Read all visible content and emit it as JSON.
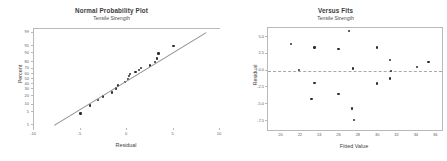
{
  "figure": {
    "panels": [
      "normal-probability-plot",
      "versus-fits"
    ]
  },
  "chart_data": [
    {
      "type": "scatter",
      "id": "normal-probability-plot",
      "title": "Normal Probability Plot",
      "subtitle": "Tensile Strength",
      "xlabel": "Residual",
      "ylabel": "Percent",
      "xlim": [
        -10,
        10
      ],
      "xticks": [
        -10,
        -5,
        0,
        5,
        10
      ],
      "xticklabels": [
        "-10",
        "-5",
        "0",
        "5",
        "10"
      ],
      "yscale": "normal-probability",
      "yticks": [
        1,
        5,
        10,
        20,
        30,
        40,
        50,
        60,
        70,
        80,
        90,
        95,
        99
      ],
      "yticklabels": [
        "1",
        "5",
        "10",
        "20",
        "30",
        "40",
        "50",
        "60",
        "70",
        "80",
        "90",
        "95",
        "99"
      ],
      "grid": false,
      "legend": "none",
      "reference_line": {
        "label": "normal fit line",
        "x1": -7.8,
        "y1": 1,
        "x2": 8.5,
        "y2": 99
      },
      "points": [
        {
          "x": -5.0,
          "y": 4.2
        },
        {
          "x": -4.0,
          "y": 9.0
        },
        {
          "x": -3.1,
          "y": 14.5
        },
        {
          "x": -2.6,
          "y": 19.0
        },
        {
          "x": -1.6,
          "y": 25.0
        },
        {
          "x": -1.2,
          "y": 31.5
        },
        {
          "x": -1.0,
          "y": 37.0
        },
        {
          "x": -0.2,
          "y": 43.5
        },
        {
          "x": 0.1,
          "y": 50.0
        },
        {
          "x": 0.2,
          "y": 56.0
        },
        {
          "x": 0.3,
          "y": 59.5
        },
        {
          "x": 0.9,
          "y": 63.5
        },
        {
          "x": 1.3,
          "y": 68.0
        },
        {
          "x": 1.5,
          "y": 70.5
        },
        {
          "x": 2.5,
          "y": 75.0
        },
        {
          "x": 3.0,
          "y": 80.5
        },
        {
          "x": 3.2,
          "y": 85.0
        },
        {
          "x": 3.4,
          "y": 90.0
        },
        {
          "x": 5.0,
          "y": 95.0
        }
      ]
    },
    {
      "type": "scatter",
      "id": "versus-fits",
      "title": "Versus Fits",
      "subtitle": "Tensile Strength",
      "xlabel": "Fitted Value",
      "ylabel": "Residual",
      "xlim": [
        18.6,
        36.6
      ],
      "xticks": [
        20,
        22,
        24,
        26,
        28,
        30,
        32,
        34,
        36
      ],
      "xticklabels": [
        "20",
        "22",
        "24",
        "26",
        "28",
        "30",
        "32",
        "34",
        "36"
      ],
      "ylim": [
        -8.8,
        6.3
      ],
      "yticks": [
        5.0,
        2.5,
        0.0,
        -2.5,
        -5.0,
        -7.5
      ],
      "yticklabels": [
        "5.0",
        "2.5",
        "0.0",
        "-2.5",
        "-5.0",
        "-7.5"
      ],
      "grid": false,
      "legend": "none",
      "reference_line": {
        "label": "zero residual line",
        "y": 0.0,
        "style": "dashed"
      },
      "points": [
        {
          "x": 21.0,
          "y": 3.9
        },
        {
          "x": 21.8,
          "y": 0.1
        },
        {
          "x": 23.1,
          "y": -4.2
        },
        {
          "x": 23.4,
          "y": 3.4
        },
        {
          "x": 23.4,
          "y": -1.8
        },
        {
          "x": 25.9,
          "y": 3.2
        },
        {
          "x": 25.9,
          "y": -3.5
        },
        {
          "x": 27.0,
          "y": 5.9
        },
        {
          "x": 27.4,
          "y": 0.3
        },
        {
          "x": 27.3,
          "y": -5.6
        },
        {
          "x": 27.5,
          "y": -7.3
        },
        {
          "x": 29.9,
          "y": 3.4
        },
        {
          "x": 29.9,
          "y": -1.9
        },
        {
          "x": 31.2,
          "y": 1.6
        },
        {
          "x": 31.3,
          "y": -0.1
        },
        {
          "x": 31.2,
          "y": -1.2
        },
        {
          "x": 34.0,
          "y": 0.5
        },
        {
          "x": 35.2,
          "y": 1.3
        }
      ]
    }
  ]
}
